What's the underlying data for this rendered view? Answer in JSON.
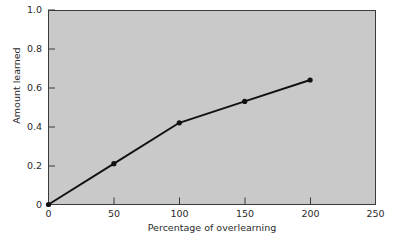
{
  "chart_data": {
    "type": "line",
    "title": "",
    "xlabel": "Percentage of overlearning",
    "ylabel": "Amount learned",
    "x": [
      0,
      50,
      100,
      150,
      200
    ],
    "values": [
      0,
      0.21,
      0.42,
      0.53,
      0.64
    ],
    "series": [
      {
        "name": "Amount learned",
        "x": [
          0,
          50,
          100,
          150,
          200
        ],
        "values": [
          0,
          0.21,
          0.42,
          0.53,
          0.64
        ]
      }
    ],
    "xlim": [
      0,
      250
    ],
    "ylim": [
      0,
      1.0
    ],
    "xticks": [
      "0",
      "50",
      "100",
      "150",
      "200",
      "250"
    ],
    "xtick_values": [
      0,
      50,
      100,
      150,
      200,
      250
    ],
    "yticks": [
      "0",
      "0.2",
      "0.4",
      "0.6",
      "0.8",
      "1.0"
    ],
    "ytick_values": [
      0,
      0.2,
      0.4,
      0.6,
      0.8,
      1.0
    ],
    "grid": false,
    "legend": null,
    "marker": "filled-circle",
    "line_color": "#111111",
    "marker_color": "#111111",
    "plot_background": "#c9c9c9",
    "figure_background": "#ffffff",
    "axis_color": "#3a3a3a"
  },
  "figure": {
    "xaxis_label": "Percentage of overlearning",
    "yaxis_label": "Amount learned",
    "ytick_labels": [
      "0",
      "0.2",
      "0.4",
      "0.6",
      "0.8",
      "1.0"
    ],
    "xtick_labels": [
      "0",
      "50",
      "100",
      "150",
      "200",
      "250"
    ]
  }
}
